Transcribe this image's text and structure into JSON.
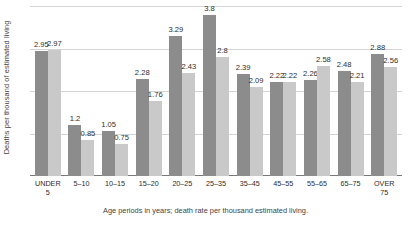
{
  "chart_data": {
    "type": "bar",
    "title": "",
    "xlabel": "Age periods in years; death rate per thousand estimated living.",
    "ylabel": "Deaths per thousand of estimated living",
    "categories": [
      "UNDER\n5",
      "5–10",
      "10–15",
      "15–20",
      "20–25",
      "25–35",
      "35–45",
      "45–55",
      "55–65",
      "65–75",
      "OVER\n75"
    ],
    "series": [
      {
        "name": "series-1",
        "color": "#8c8c8c",
        "values": [
          2.95,
          1.2,
          1.05,
          2.28,
          3.29,
          3.8,
          2.39,
          2.22,
          2.26,
          2.48,
          2.88
        ]
      },
      {
        "name": "series-2",
        "color": "#c9c9c9",
        "values": [
          2.97,
          0.85,
          0.75,
          1.76,
          2.43,
          2.8,
          2.09,
          2.22,
          2.58,
          2.21,
          2.56
        ]
      }
    ],
    "ylim": [
      0,
      4
    ],
    "gridlines": [
      1,
      2,
      3,
      4
    ],
    "grid": true,
    "legend": "none",
    "axis_line_color": "#7a7a7a",
    "grid_color": "#d4d4d4",
    "background": "#ffffff"
  }
}
